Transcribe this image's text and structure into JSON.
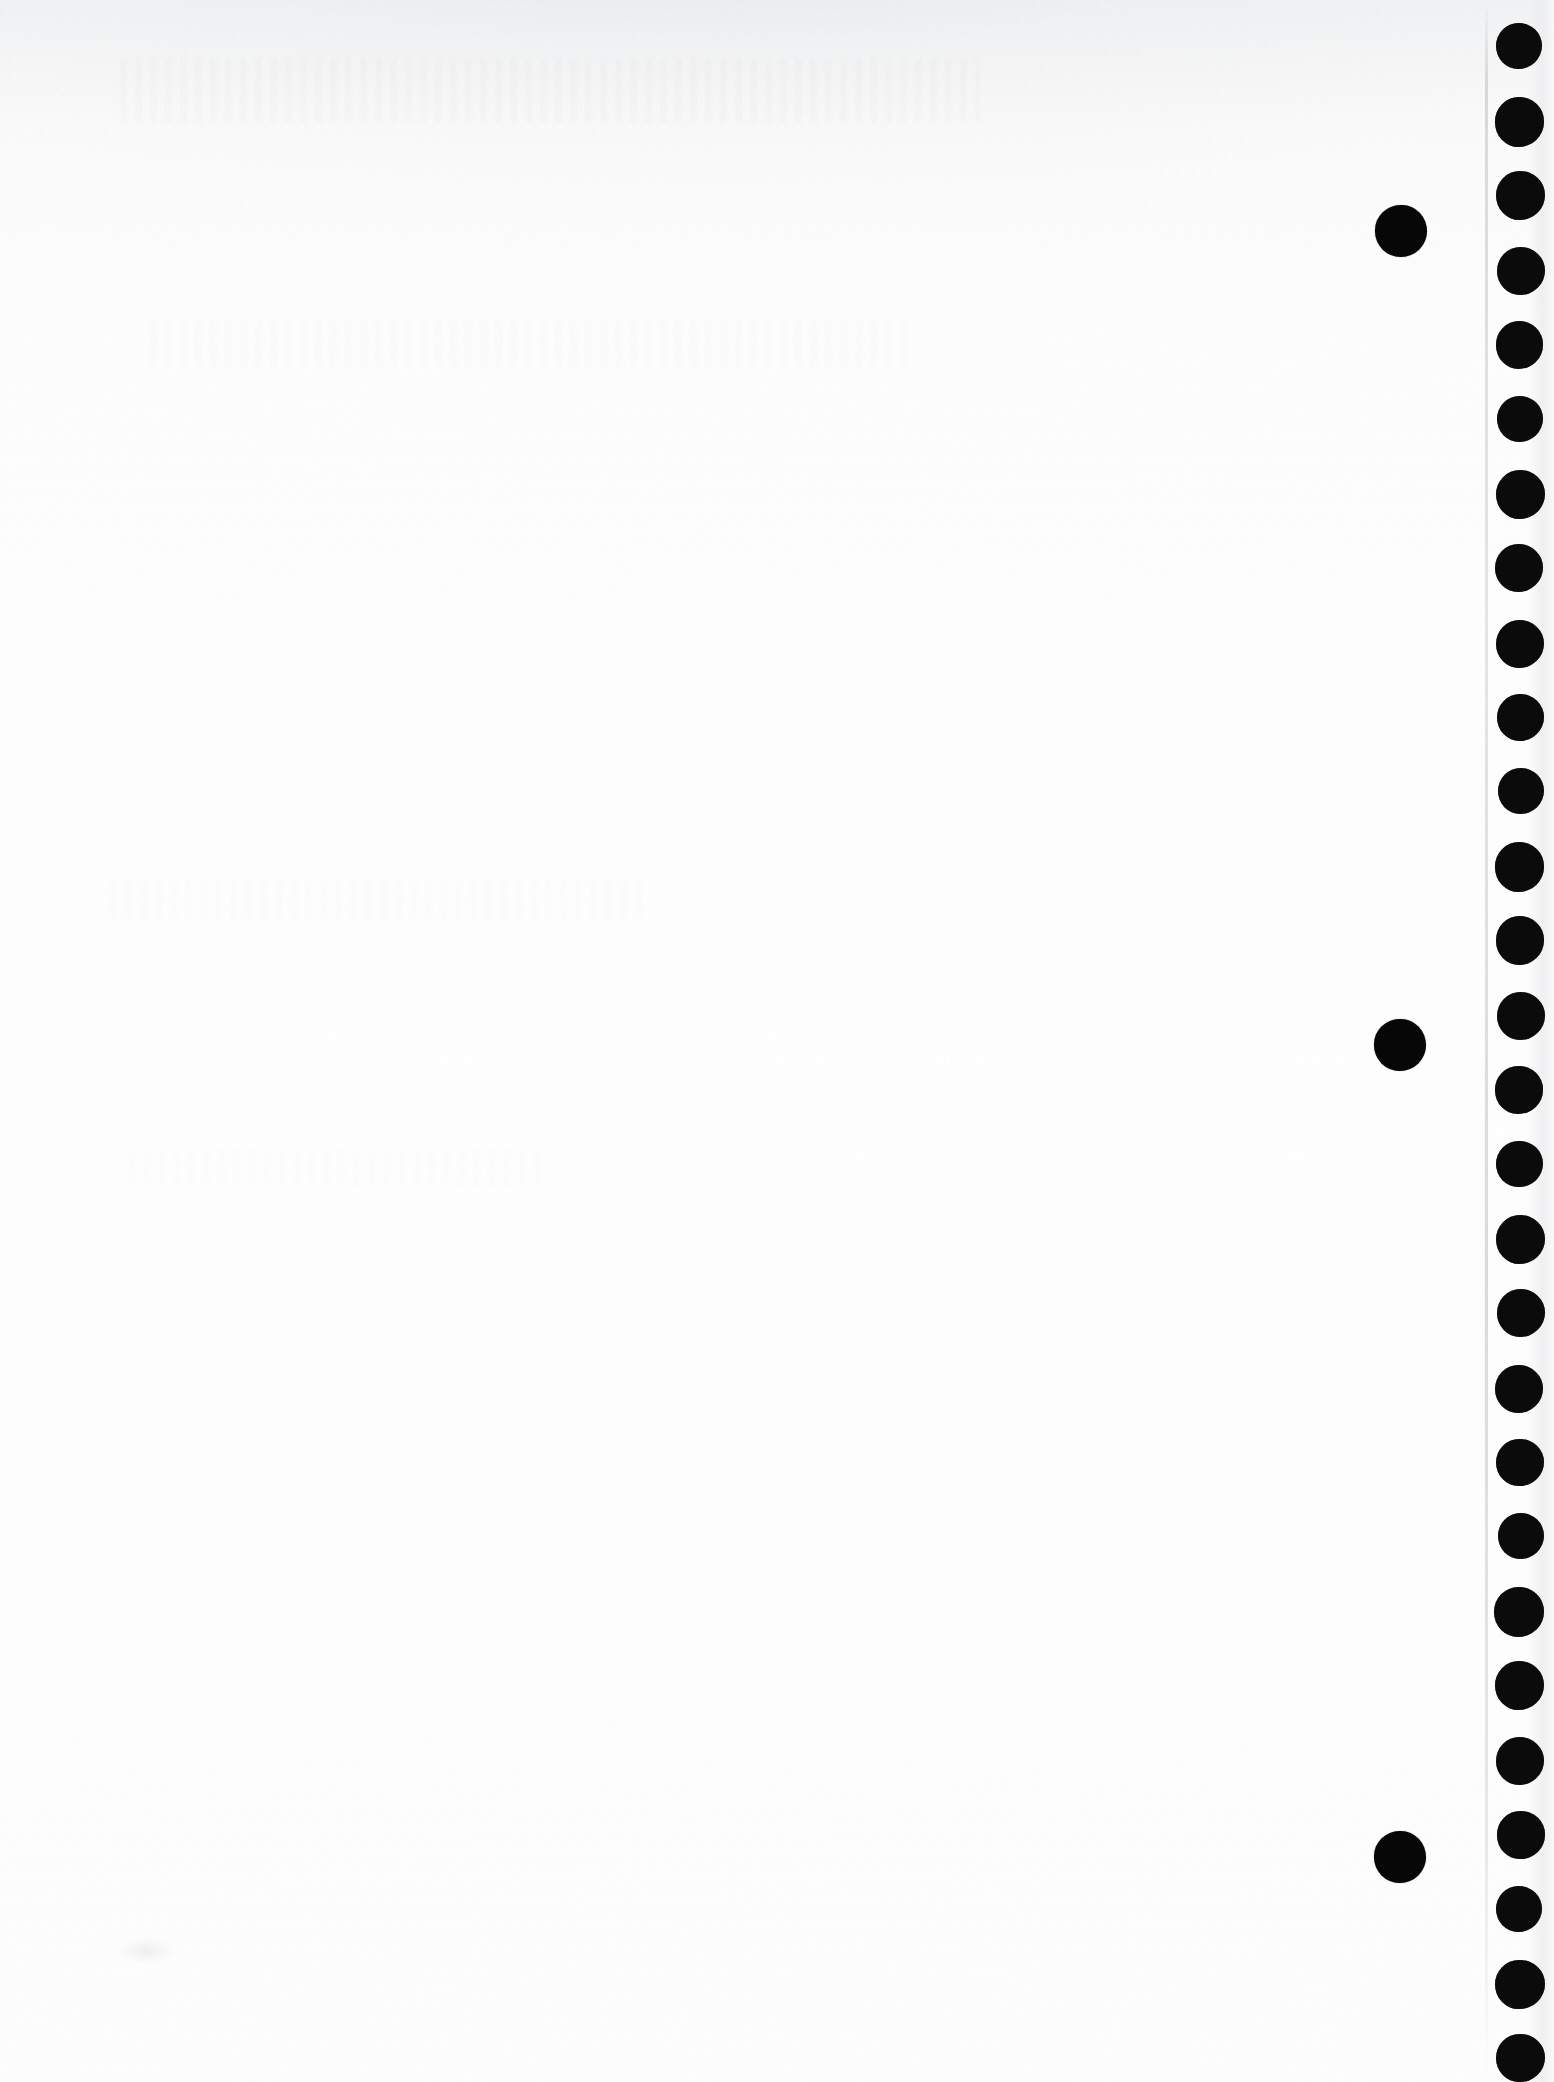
{
  "document": {
    "kind": "scanned-page",
    "title": "Scanned blank page with edge registration dots",
    "page_width": 1554,
    "page_height": 2082,
    "background_color": "#fdfdfd",
    "ink_color": "#0b0b0b",
    "body_text": "",
    "visible_text": []
  },
  "marks": {
    "edge_dot_column": {
      "label": "edge-registration-dot-column",
      "count": 28,
      "center_x": 1520,
      "diameter": 48,
      "pitch": 74.5,
      "first_center_y": 47,
      "color": "#0b0b0b"
    },
    "isolated_dots": {
      "label": "isolated-registration-dots",
      "count": 3,
      "diameter": 52,
      "color": "#070707",
      "points": [
        {
          "cx": 1401,
          "cy": 231
        },
        {
          "cx": 1400,
          "cy": 1045
        },
        {
          "cx": 1400,
          "cy": 1857
        }
      ]
    },
    "scan_edge_line": {
      "label": "paper-edge-crease-line",
      "x": 1485,
      "color": "#aaacb0"
    }
  }
}
